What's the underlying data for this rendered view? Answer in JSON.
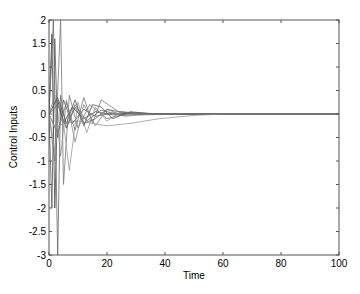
{
  "chart_data": {
    "type": "line",
    "title": "",
    "xlabel": "Time",
    "ylabel": "Control Inputs",
    "xlim": [
      0,
      100
    ],
    "ylim": [
      -3,
      2
    ],
    "xticks": [
      0,
      20,
      40,
      60,
      80,
      100
    ],
    "yticks": [
      -3,
      -2.5,
      -2,
      -1.5,
      -1,
      -0.5,
      0,
      0.5,
      1,
      1.5,
      2
    ],
    "grid": false,
    "legend": null,
    "line_color": "#666666",
    "series": [
      {
        "name": "u1",
        "x": [
          0,
          1,
          2,
          3,
          5,
          8,
          12,
          16,
          22,
          30,
          40,
          100
        ],
        "values": [
          0,
          1.7,
          -2.0,
          0.3,
          -0.2,
          0.15,
          -0.1,
          0.05,
          -0.02,
          0.01,
          0,
          0
        ]
      },
      {
        "name": "u2",
        "x": [
          0,
          1,
          2,
          3,
          5,
          8,
          12,
          16,
          22,
          30,
          40,
          100
        ],
        "values": [
          0,
          -2.0,
          1.6,
          -0.5,
          0.3,
          -0.2,
          0.1,
          -0.05,
          0.02,
          0,
          0,
          0
        ]
      },
      {
        "name": "u3",
        "x": [
          0,
          1.5,
          3,
          4,
          6,
          9,
          13,
          18,
          25,
          35,
          100
        ],
        "values": [
          0,
          2.0,
          -3.0,
          0.4,
          -0.3,
          0.2,
          -0.15,
          0.08,
          -0.03,
          0,
          0
        ]
      },
      {
        "name": "u4",
        "x": [
          0,
          2,
          4,
          5,
          7,
          10,
          14,
          20,
          28,
          40,
          100
        ],
        "values": [
          0,
          -1.0,
          2.0,
          -1.5,
          0.4,
          -0.3,
          0.2,
          -0.1,
          0.03,
          0,
          0
        ]
      },
      {
        "name": "u5",
        "x": [
          0,
          2,
          4,
          6,
          9,
          12,
          16,
          20,
          26,
          35,
          100
        ],
        "values": [
          0,
          0.4,
          -0.9,
          0.3,
          -0.6,
          0.2,
          -0.25,
          0.1,
          -0.05,
          0,
          0
        ]
      },
      {
        "name": "u6",
        "x": [
          0,
          2,
          4,
          7,
          10,
          13,
          16,
          20,
          25,
          32,
          100
        ],
        "values": [
          0,
          -0.8,
          0.3,
          -1.2,
          0.25,
          -0.4,
          0.15,
          -0.15,
          0.05,
          0,
          0
        ]
      },
      {
        "name": "u7",
        "x": [
          0,
          3,
          6,
          9,
          12,
          15,
          18,
          22,
          28,
          36,
          100
        ],
        "values": [
          0,
          0.35,
          -0.2,
          0.3,
          -0.25,
          0.2,
          0.15,
          -0.1,
          0.05,
          0,
          0
        ]
      },
      {
        "name": "u8",
        "x": [
          0,
          3,
          6,
          9,
          12,
          15,
          18,
          24,
          32,
          45,
          100
        ],
        "values": [
          0,
          -0.4,
          0.25,
          -0.35,
          0.35,
          -0.2,
          0.3,
          0.05,
          -0.02,
          0,
          0
        ]
      },
      {
        "name": "u9",
        "x": [
          0,
          2,
          5,
          10,
          15,
          20,
          28,
          38,
          50,
          60,
          100
        ],
        "values": [
          0,
          -0.3,
          -0.2,
          -0.15,
          -0.2,
          -0.25,
          -0.2,
          -0.1,
          -0.03,
          0,
          0
        ]
      },
      {
        "name": "u10",
        "x": [
          0,
          3,
          6,
          9,
          12,
          16,
          20,
          24,
          30,
          40,
          100
        ],
        "values": [
          0,
          0.2,
          -0.3,
          0.15,
          -0.2,
          -0.1,
          0.1,
          0.05,
          0.02,
          0,
          0
        ]
      }
    ]
  }
}
